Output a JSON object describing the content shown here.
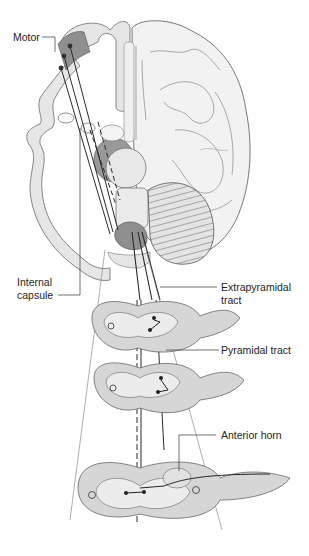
{
  "figure": {
    "type": "anatomical diagram",
    "labels": {
      "motor": "Motor",
      "internal_capsule_1": "Internal",
      "internal_capsule_2": "capsule",
      "extrapyramidal_1": "Extrapyramidal",
      "extrapyramidal_2": "tract",
      "pyramidal": "Pyramidal tract",
      "anterior_horn": "Anterior horn"
    },
    "colors": {
      "tissue_light": "#e9e9e9",
      "tissue_mid": "#cfcfcf",
      "tissue_dark": "#8f8f8f",
      "outline": "#555555",
      "tract": "#2a2a2a"
    },
    "spinal_sections": 3
  }
}
